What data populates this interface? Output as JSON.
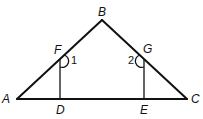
{
  "diagram": {
    "points": {
      "A": {
        "label": "A",
        "x": 17,
        "y": 99
      },
      "B": {
        "label": "B",
        "x": 102,
        "y": 20
      },
      "C": {
        "label": "C",
        "x": 187,
        "y": 99
      },
      "D": {
        "label": "D",
        "x": 60,
        "y": 99
      },
      "E": {
        "label": "E",
        "x": 144,
        "y": 99
      },
      "F": {
        "label": "F",
        "x": 60,
        "y": 59
      },
      "G": {
        "label": "G",
        "x": 144,
        "y": 59
      }
    },
    "segments": [
      "AB",
      "BC",
      "AC",
      "FD",
      "GE"
    ],
    "angles": [
      {
        "label": "1",
        "vertex": "F",
        "between": [
          "B",
          "D"
        ]
      },
      {
        "label": "2",
        "vertex": "G",
        "between": [
          "B",
          "E"
        ]
      }
    ],
    "stroke_color": "#111111"
  }
}
